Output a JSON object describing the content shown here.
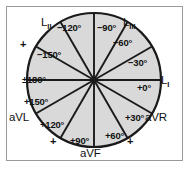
{
  "figure": {
    "fill_color": "#d9d9d9",
    "stroke_color": "#1a1a1a",
    "frame_color": "#9a9a9a",
    "background_color": "#ffffff",
    "circle": {
      "cx": 94,
      "cy": 80,
      "r": 67
    }
  },
  "degree_labels": [
    {
      "key": "minus_120",
      "text": "−120°",
      "x": 57,
      "y": 23
    },
    {
      "key": "minus_90",
      "text": "−90°",
      "x": 97,
      "y": 23
    },
    {
      "key": "minus_60",
      "text": "−60°",
      "x": 113,
      "y": 38
    },
    {
      "key": "minus_30",
      "text": "−30°",
      "x": 128,
      "y": 58
    },
    {
      "key": "plus_0",
      "text": "+0°",
      "x": 137,
      "y": 83
    },
    {
      "key": "plus_30",
      "text": "+30°",
      "x": 125,
      "y": 113
    },
    {
      "key": "plus_60",
      "text": "+60°",
      "x": 105,
      "y": 131
    },
    {
      "key": "plus_90",
      "text": "+90°",
      "x": 70,
      "y": 136
    },
    {
      "key": "plus_120",
      "text": "+120°",
      "x": 40,
      "y": 120
    },
    {
      "key": "plus_150",
      "text": "+150°",
      "x": 24,
      "y": 97
    },
    {
      "key": "pm_180",
      "text": "±180°",
      "x": 22,
      "y": 75
    },
    {
      "key": "minus_150",
      "text": "−150°",
      "x": 37,
      "y": 50
    }
  ],
  "lead_labels": [
    {
      "key": "L2",
      "main": "L",
      "sub": "II",
      "x": 41,
      "y": 17
    },
    {
      "key": "L3",
      "main": "L",
      "sub": "III",
      "x": 123,
      "y": 17
    },
    {
      "key": "L1",
      "main": "L",
      "sub": "I",
      "x": 161,
      "y": 75
    },
    {
      "key": "aVR",
      "main": "aVR",
      "sub": "",
      "x": 145,
      "y": 112
    },
    {
      "key": "aVF",
      "main": "aVF",
      "sub": "",
      "x": 80,
      "y": 148
    },
    {
      "key": "aVL",
      "main": "aVL",
      "sub": "",
      "x": 9,
      "y": 112
    }
  ],
  "plus_markers": [
    {
      "key": "plus-upper-left",
      "text": "+",
      "x": 20,
      "y": 39
    },
    {
      "key": "plus-lower-left",
      "text": "+",
      "x": 50,
      "y": 136
    },
    {
      "key": "plus-lower-right",
      "text": "+",
      "x": 127,
      "y": 136
    }
  ],
  "axis_angles_deg": [
    0,
    30,
    60,
    90,
    120,
    150
  ]
}
